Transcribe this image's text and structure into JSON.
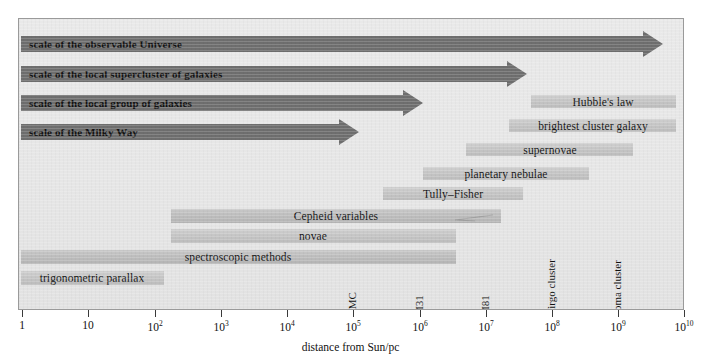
{
  "chart_data": {
    "type": "bar",
    "title": "",
    "subtitle": "",
    "xlabel": "distance from Sun/pc",
    "ylabel": "",
    "xscale": "log",
    "xlim": [
      1,
      10000000000
    ],
    "grid": false,
    "legend": null,
    "orientation": "horizontal",
    "x_tick_labels": [
      "1",
      "10",
      "10²",
      "10³",
      "10⁴",
      "10⁵",
      "10⁶",
      "10⁷",
      "10⁸",
      "10⁹",
      "10¹⁰"
    ],
    "x_tick_values": [
      1,
      10,
      100,
      1000,
      10000,
      100000,
      1000000,
      10000000,
      100000000,
      1000000000,
      10000000000
    ],
    "scale_arrows": [
      {
        "label": "scale of the observable Universe",
        "start_pc": 1,
        "end_pc": 5000000000.0,
        "style": "arrow"
      },
      {
        "label": "scale of the local supercluster of galaxies",
        "start_pc": 1,
        "end_pc": 40000000.0,
        "style": "arrow"
      },
      {
        "label": "scale of the local group of galaxies",
        "start_pc": 1,
        "end_pc": 1100000.0,
        "style": "arrow"
      },
      {
        "label": "scale of the Milky Way",
        "start_pc": 1,
        "end_pc": 130000.0,
        "style": "arrow"
      }
    ],
    "method_bars": [
      {
        "label": "Hubble's law",
        "start_pc": 20000000.0,
        "end_pc": 3000000000.0,
        "label_align": "center"
      },
      {
        "label": "brightest cluster galaxy",
        "start_pc": 7000000.0,
        "end_pc": 3000000000.0,
        "label_align": "center"
      },
      {
        "label": "supernovae",
        "start_pc": 1300000.0,
        "end_pc": 300000000.0,
        "label_align": "center"
      },
      {
        "label": "planetary nebulae",
        "start_pc": 110000.0,
        "end_pc": 30000000.0,
        "label_align": "center"
      },
      {
        "label": "Tully–Fisher",
        "start_pc": 800000.0,
        "end_pc": 35000000.0,
        "label_align": "center"
      },
      {
        "label": "Cepheid variables",
        "start_pc": 180.0,
        "end_pc": 1300000.0,
        "label_align": "center"
      },
      {
        "label": "novae",
        "start_pc": 180.0,
        "end_pc": 200000.0,
        "label_align": "center"
      },
      {
        "label": "spectroscopic methods",
        "start_pc": 1,
        "end_pc": 200000.0,
        "label_align": "center"
      },
      {
        "label": "trigonometric parallax",
        "start_pc": 1,
        "end_pc": 120.0,
        "label_align": "center"
      }
    ],
    "object_markers": [
      {
        "label": "LMC",
        "distance_pc": 50000.0
      },
      {
        "label": "M31",
        "distance_pc": 750000.0
      },
      {
        "label": "M81",
        "distance_pc": 3500000.0
      },
      {
        "label": "Virgo cluster",
        "distance_pc": 17000000.0
      },
      {
        "label": "coma cluster",
        "distance_pc": 90000000.0
      }
    ]
  },
  "axis": {
    "title": "distance from Sun/pc",
    "ticks": [
      {
        "label": "1",
        "sup": "",
        "x": 22
      },
      {
        "label": "10",
        "sup": "",
        "x": 88
      },
      {
        "label": "10",
        "sup": "2",
        "x": 155
      },
      {
        "label": "10",
        "sup": "3",
        "x": 221
      },
      {
        "label": "10",
        "sup": "4",
        "x": 287
      },
      {
        "label": "10",
        "sup": "5",
        "x": 353
      },
      {
        "label": "10",
        "sup": "6",
        "x": 420
      },
      {
        "label": "10",
        "sup": "7",
        "x": 486
      },
      {
        "label": "10",
        "sup": "8",
        "x": 552
      },
      {
        "label": "10",
        "sup": "9",
        "x": 618
      },
      {
        "label": "10",
        "sup": "10",
        "x": 684
      }
    ]
  },
  "arrows": [
    {
      "name": "observable-universe",
      "label": "scale of the observable Universe",
      "x": 20,
      "y": 30,
      "w": 642,
      "h": 16
    },
    {
      "name": "local-supercluster",
      "label": "scale of the local supercluster of galaxies",
      "x": 20,
      "y": 60,
      "w": 506,
      "h": 16
    },
    {
      "name": "local-group",
      "label": "scale of the local group of galaxies",
      "x": 20,
      "y": 89,
      "w": 402,
      "h": 16
    },
    {
      "name": "milky-way",
      "label": "scale of the Milky Way",
      "x": 20,
      "y": 118,
      "w": 338,
      "h": 16
    }
  ],
  "bars": [
    {
      "name": "hubbles-law",
      "label": "Hubble's law",
      "x": 530,
      "y": 94,
      "w": 145,
      "h": 13,
      "label_x": 602,
      "label_y": 96
    },
    {
      "name": "brightest-cluster-galaxy",
      "label": "brightest cluster galaxy",
      "x": 508,
      "y": 118,
      "w": 167,
      "h": 13,
      "label_x": 592,
      "label_y": 120
    },
    {
      "name": "supernovae",
      "label": "supernovae",
      "x": 465,
      "y": 142,
      "w": 167,
      "h": 13,
      "label_x": 549,
      "label_y": 144
    },
    {
      "name": "planetary-nebulae",
      "label": "planetary nebulae",
      "x": 422,
      "y": 166,
      "w": 166,
      "h": 13,
      "label_x": 505,
      "label_y": 168
    },
    {
      "name": "tully-fisher",
      "label": "Tully–Fisher",
      "x": 382,
      "y": 186,
      "w": 140,
      "h": 13,
      "label_x": 452,
      "label_y": 188
    },
    {
      "name": "cepheid-variables",
      "label": "Cepheid variables",
      "x": 170,
      "y": 208,
      "w": 330,
      "h": 14,
      "label_x": 335,
      "label_y": 210
    },
    {
      "name": "novae",
      "label": "novae",
      "x": 170,
      "y": 228,
      "w": 285,
      "h": 14,
      "label_x": 312,
      "label_y": 230
    },
    {
      "name": "spectroscopic-methods",
      "label": "spectroscopic methods",
      "x": 20,
      "y": 249,
      "w": 435,
      "h": 14,
      "label_x": 237,
      "label_y": 251
    },
    {
      "name": "trigonometric-parallax",
      "label": "trigonometric parallax",
      "x": 20,
      "y": 270,
      "w": 143,
      "h": 14,
      "label_x": 91,
      "label_y": 272
    }
  ],
  "markers": [
    {
      "name": "lmc",
      "label": "LMC",
      "x": 353
    },
    {
      "name": "m31",
      "label": "M31",
      "x": 420
    },
    {
      "name": "m81",
      "label": "M81",
      "x": 486
    },
    {
      "name": "virgo-cluster",
      "label": "Virgo cluster",
      "x": 552
    },
    {
      "name": "coma-cluster",
      "label": "coma cluster",
      "x": 618
    }
  ]
}
